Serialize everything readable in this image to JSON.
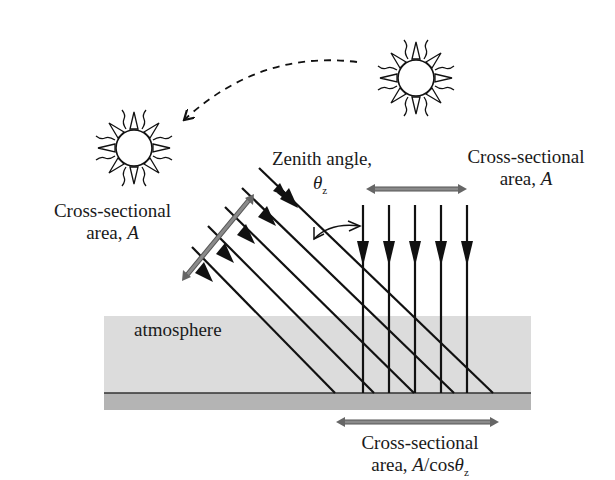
{
  "diagram": {
    "colors": {
      "line": "#111111",
      "atmosphere": "#dcdcdc",
      "ground": "#b4b4b4",
      "area_arrow": "#808080"
    },
    "suns": [
      {
        "name": "sun-overhead",
        "cx": 416,
        "cy": 78
      },
      {
        "name": "sun-low",
        "cx": 134,
        "cy": 148
      }
    ],
    "labels": {
      "zenith_angle": "Zenith angle,",
      "zenith_symbol": "θ",
      "zenith_subscript": "z",
      "cross_section_top": "Cross-sectional",
      "cross_section_top_area": "area, ",
      "cross_section_top_var": "A",
      "cross_section_left": "Cross-sectional",
      "cross_section_left_area": "area, ",
      "cross_section_left_var": "A",
      "atmosphere": "atmosphere",
      "cross_section_bottom": "Cross-sectional",
      "cross_section_bottom_area": "area, ",
      "cross_section_bottom_var": "A",
      "cross_section_bottom_rest": "/cos",
      "cross_section_bottom_symbol": "θ",
      "cross_section_bottom_subscript": "z"
    },
    "vertical_rays_x": [
      363,
      389,
      415,
      441,
      467
    ],
    "slanted_rays": [
      {
        "start": [
          259,
          168
        ],
        "end": [
          493,
          393
        ]
      },
      {
        "start": [
          242,
          188
        ],
        "end": [
          454,
          393
        ]
      },
      {
        "start": [
          225,
          207
        ],
        "end": [
          414,
          393
        ]
      },
      {
        "start": [
          208,
          226
        ],
        "end": [
          374,
          393
        ]
      },
      {
        "start": [
          192,
          247
        ],
        "end": [
          335,
          393
        ]
      }
    ]
  }
}
